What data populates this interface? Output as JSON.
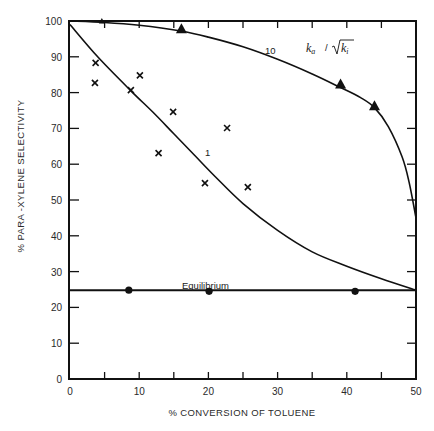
{
  "chart_data": {
    "type": "scatter",
    "title": "",
    "xlabel": "% CONVERSION OF TOLUENE",
    "ylabel": "% PARA -XYLENE SELECTIVITY",
    "xlim": [
      0,
      50
    ],
    "ylim": [
      0,
      100
    ],
    "grid": false,
    "x_ticks": [
      0,
      10,
      20,
      30,
      40,
      50
    ],
    "x_minor_ticks": [
      5,
      15,
      25,
      35,
      45
    ],
    "y_ticks": [
      0,
      10,
      20,
      30,
      40,
      50,
      60,
      70,
      80,
      90,
      100
    ],
    "series": [
      {
        "name": "k_a/sqrt(k_i) = 10",
        "kind": "curve",
        "label": "10",
        "points": [
          [
            0,
            100
          ],
          [
            5,
            99.6
          ],
          [
            10,
            98.8
          ],
          [
            16,
            97.2
          ],
          [
            20,
            95.5
          ],
          [
            25,
            92.8
          ],
          [
            30,
            89.3
          ],
          [
            35,
            85.2
          ],
          [
            39,
            81.5
          ],
          [
            42,
            78.6
          ],
          [
            44,
            75.8
          ],
          [
            46,
            70.5
          ],
          [
            48,
            62.0
          ],
          [
            49,
            55.0
          ],
          [
            50,
            45.0
          ]
        ]
      },
      {
        "name": "k_a/sqrt(k_i) = 1",
        "kind": "curve",
        "label": "1",
        "points": [
          [
            0,
            99
          ],
          [
            4,
            90
          ],
          [
            8.8,
            80.5
          ],
          [
            12,
            74.5
          ],
          [
            15,
            68.5
          ],
          [
            18,
            62.5
          ],
          [
            21,
            56.5
          ],
          [
            25,
            49.0
          ],
          [
            30,
            41.5
          ],
          [
            35,
            35.5
          ],
          [
            40,
            31.5
          ],
          [
            45,
            28.0
          ],
          [
            50,
            24.8
          ]
        ]
      },
      {
        "name": "Equilibrium",
        "kind": "line",
        "label": "Equilibrium",
        "points": [
          [
            0,
            24.8
          ],
          [
            50,
            24.8
          ]
        ]
      },
      {
        "name": "Triangles (k ratio 10 data)",
        "kind": "markers",
        "marker": "triangle",
        "points": [
          [
            4.6,
            99.8
          ],
          [
            16.1,
            97.5
          ],
          [
            39.1,
            82.1
          ],
          [
            44.0,
            76.0
          ]
        ]
      },
      {
        "name": "Crosses (k ratio 1 data)",
        "kind": "markers",
        "marker": "cross",
        "points": [
          [
            3.7,
            88.3
          ],
          [
            3.6,
            82.7
          ],
          [
            10.1,
            84.8
          ],
          [
            8.8,
            80.7
          ],
          [
            14.9,
            74.6
          ],
          [
            12.8,
            63.1
          ],
          [
            22.7,
            70.1
          ],
          [
            19.5,
            54.7
          ],
          [
            25.7,
            53.6
          ]
        ]
      },
      {
        "name": "Equilibrium data",
        "kind": "markers",
        "marker": "dot",
        "points": [
          [
            8.5,
            24.8
          ],
          [
            20.1,
            24.5
          ],
          [
            41.2,
            24.5
          ]
        ]
      }
    ],
    "annotations": [
      {
        "text": "10",
        "x": 28.7,
        "y": 91.5
      },
      {
        "text": "1",
        "x": 19.6,
        "y": 63.5
      },
      {
        "text": "Equilibrium",
        "x": 21.5,
        "y": 27.5
      },
      {
        "text": "k_a / sqrt(k_i)",
        "x": 38.5,
        "y": 92
      }
    ],
    "legend": "none"
  },
  "labels": {
    "x_axis_title": "% CONVERSION OF TOLUENE",
    "y_axis_title": "% PARA -XYLENE SELECTIVITY",
    "curve_10": "10",
    "curve_1": "1",
    "equilibrium": "Equilibrium",
    "ratio_k": "k",
    "ratio_a": "a",
    "ratio_slash": "/",
    "ratio_ki": "k",
    "ratio_i": "i"
  }
}
